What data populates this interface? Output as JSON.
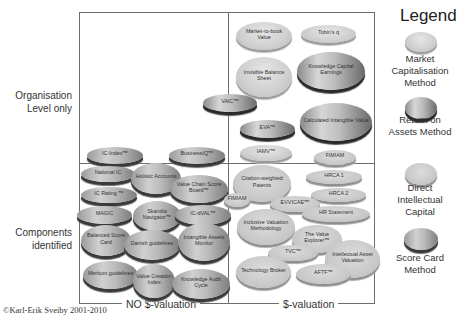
{
  "chart_data": {
    "type": "table",
    "x_axis": {
      "left": "NO $-valuation",
      "right": "$-valuation"
    },
    "y_axis": {
      "top": "Organisation Level only",
      "bottom": "Components identified"
    },
    "legend": [
      {
        "key": "mc",
        "label": "Market Capitalisation Method"
      },
      {
        "key": "roa",
        "label": "Return on Assets Method"
      },
      {
        "key": "dic",
        "label": "Direct Intellectual Capital"
      },
      {
        "key": "sc",
        "label": "Score Card Method"
      }
    ],
    "methods": [
      {
        "name": "Market-to-book Value",
        "type": "mc",
        "quadrant": "organisation / $-valuation",
        "x": 236,
        "y": 22,
        "w": 56,
        "h": 28
      },
      {
        "name": "Tobin's q",
        "type": "mc",
        "quadrant": "organisation / $-valuation",
        "x": 301,
        "y": 25,
        "w": 55,
        "h": 18
      },
      {
        "name": "Invisible Balance Sheet",
        "type": "mc",
        "quadrant": "organisation / $-valuation",
        "x": 236,
        "y": 57,
        "w": 56,
        "h": 40
      },
      {
        "name": "Knowledge Capital Earnings",
        "type": "roa",
        "quadrant": "organisation / $-valuation",
        "x": 297,
        "y": 52,
        "w": 68,
        "h": 38
      },
      {
        "name": "VAIC™",
        "type": "roa",
        "quadrant": "organisation / $-valuation",
        "x": 203,
        "y": 94,
        "w": 54,
        "h": 18
      },
      {
        "name": "Calculated Intangible Value",
        "type": "roa",
        "quadrant": "organisation / $-valuation",
        "x": 300,
        "y": 103,
        "w": 72,
        "h": 38
      },
      {
        "name": "EVA™",
        "type": "roa",
        "quadrant": "organisation / $-valuation",
        "x": 240,
        "y": 120,
        "w": 55,
        "h": 18
      },
      {
        "name": "IAMV™",
        "type": "mc",
        "quadrant": "organisation / $-valuation",
        "x": 240,
        "y": 145,
        "w": 52,
        "h": 16
      },
      {
        "name": "IC-Index™",
        "type": "sc",
        "quadrant": "organisation / no-$",
        "x": 87,
        "y": 147,
        "w": 56,
        "h": 17
      },
      {
        "name": "BusinessIQ™",
        "type": "sc",
        "quadrant": "organisation / no-$",
        "x": 169,
        "y": 147,
        "w": 56,
        "h": 17
      },
      {
        "name": "FiMIAM",
        "type": "dic",
        "quadrant": "components / $-valuation",
        "x": 314,
        "y": 150,
        "w": 42,
        "h": 15
      },
      {
        "name": "National IC",
        "type": "sc",
        "quadrant": "components / no-$",
        "x": 81,
        "y": 166,
        "w": 54,
        "h": 16
      },
      {
        "name": "Holistic Accounts",
        "type": "sc",
        "quadrant": "components / no-$",
        "x": 131,
        "y": 163,
        "w": 50,
        "h": 31
      },
      {
        "name": "Value Chain Score Board™",
        "type": "sc",
        "quadrant": "components / no-$",
        "x": 170,
        "y": 175,
        "w": 58,
        "h": 28
      },
      {
        "name": "IC Rating ™",
        "type": "sc",
        "quadrant": "components / no-$",
        "x": 81,
        "y": 187,
        "w": 56,
        "h": 16
      },
      {
        "name": "Citation-weighted Patents",
        "type": "dic",
        "quadrant": "components / $-valuation",
        "x": 233,
        "y": 165,
        "w": 58,
        "h": 37
      },
      {
        "name": "HRCA 1",
        "type": "dic",
        "quadrant": "components / $-valuation",
        "x": 306,
        "y": 170,
        "w": 56,
        "h": 14
      },
      {
        "name": "HRCA 2",
        "type": "dic",
        "quadrant": "components / $-valuation",
        "x": 311,
        "y": 188,
        "w": 55,
        "h": 14
      },
      {
        "name": "FIMIAM",
        "type": "dic",
        "quadrant": "components / $-valuation",
        "x": 224,
        "y": 193,
        "w": 26,
        "h": 14
      },
      {
        "name": "EVVICAE™",
        "type": "dic",
        "quadrant": "components / $-valuation",
        "x": 270,
        "y": 196,
        "w": 50,
        "h": 16
      },
      {
        "name": "MAGIC",
        "type": "sc",
        "quadrant": "components / no-$",
        "x": 77,
        "y": 206,
        "w": 55,
        "h": 18
      },
      {
        "name": "Skandia Navigator™",
        "type": "sc",
        "quadrant": "components / no-$",
        "x": 133,
        "y": 201,
        "w": 48,
        "h": 30
      },
      {
        "name": "IC-dVAL™",
        "type": "sc",
        "quadrant": "components / no-$",
        "x": 175,
        "y": 205,
        "w": 56,
        "h": 20
      },
      {
        "name": "HR Statement",
        "type": "dic",
        "quadrant": "components / $-valuation",
        "x": 302,
        "y": 206,
        "w": 68,
        "h": 16
      },
      {
        "name": "Inclusive Valuation Methodology",
        "type": "dic",
        "quadrant": "components / $-valuation",
        "x": 237,
        "y": 209,
        "w": 58,
        "h": 36
      },
      {
        "name": "Balanced Score Card",
        "type": "sc",
        "quadrant": "components / no-$",
        "x": 81,
        "y": 225,
        "w": 50,
        "h": 31
      },
      {
        "name": "Danish guidelines",
        "type": "sc",
        "quadrant": "components / no-$",
        "x": 124,
        "y": 230,
        "w": 56,
        "h": 30
      },
      {
        "name": "Intangible Assets Monitor",
        "type": "sc",
        "quadrant": "components / no-$",
        "x": 178,
        "y": 223,
        "w": 52,
        "h": 38
      },
      {
        "name": "The Value Explorer™",
        "type": "dic",
        "quadrant": "components / $-valuation",
        "x": 292,
        "y": 225,
        "w": 50,
        "h": 28
      },
      {
        "name": "TVC™",
        "type": "dic",
        "quadrant": "components / $-valuation",
        "x": 268,
        "y": 245,
        "w": 50,
        "h": 16
      },
      {
        "name": "Intellectual Asset Valuation",
        "type": "dic",
        "quadrant": "components / $-valuation",
        "x": 325,
        "y": 240,
        "w": 55,
        "h": 38
      },
      {
        "name": "Meritum guidelines",
        "type": "sc",
        "quadrant": "components / no-$",
        "x": 83,
        "y": 261,
        "w": 55,
        "h": 28
      },
      {
        "name": "Value Creation Index",
        "type": "sc",
        "quadrant": "components / no-$",
        "x": 133,
        "y": 264,
        "w": 42,
        "h": 34
      },
      {
        "name": "Knowledge Audit Cycle",
        "type": "sc",
        "quadrant": "components / no-$",
        "x": 172,
        "y": 269,
        "w": 58,
        "h": 30
      },
      {
        "name": "Technology Broker",
        "type": "dic",
        "quadrant": "components / $-valuation",
        "x": 236,
        "y": 256,
        "w": 55,
        "h": 32
      },
      {
        "name": "AFTF™",
        "type": "dic",
        "quadrant": "components / $-valuation",
        "x": 296,
        "y": 264,
        "w": 55,
        "h": 20
      }
    ]
  },
  "axes": {
    "y_top": "Organisation\nLevel only",
    "y_bottom": "Components\nidentified",
    "x_left": "NO $-valuation",
    "x_right": "$-valuation"
  },
  "legend": {
    "title": "Legend",
    "items": [
      {
        "label": "Market Capitalisation Method"
      },
      {
        "label": "Return on Assets Method"
      },
      {
        "label": "Direct Intellectual Capital"
      },
      {
        "label": "Score Card Method"
      }
    ]
  },
  "footer": {
    "copyright": "©Karl-Erik Sveiby 2001-2010"
  }
}
